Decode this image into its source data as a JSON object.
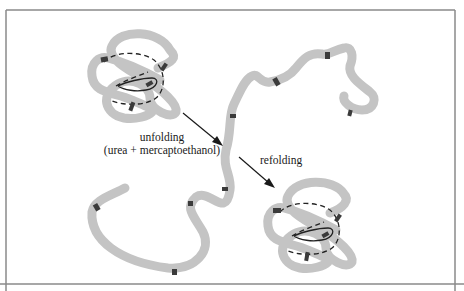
{
  "diagram": {
    "labels": {
      "unfolding_line1": "unfolding",
      "unfolding_line2": "(urea + mercaptoethanol)",
      "refolding": "refolding"
    },
    "states": [
      {
        "name": "native",
        "description": "folded chain with disulfide bonds (dashed)"
      },
      {
        "name": "unfolded",
        "description": "extended random coil, reduced cysteines"
      },
      {
        "name": "refolded",
        "description": "folded chain with disulfide bonds restored"
      }
    ],
    "colors": {
      "chain": "#c4c4c4",
      "cysteine": "#3b3b3b",
      "disulfide": "#222222",
      "arrow": "#1a1a1a",
      "frame": "#8a8a8a"
    }
  }
}
